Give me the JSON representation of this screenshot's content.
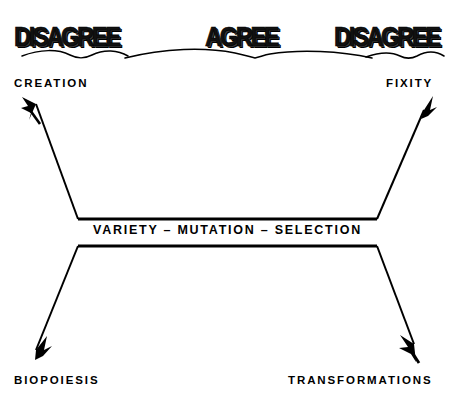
{
  "header": {
    "items": [
      {
        "label": "DISAGREE",
        "position": "left"
      },
      {
        "label": "AGREE",
        "position": "center"
      },
      {
        "label": "DISAGREE",
        "position": "right"
      }
    ],
    "divider": "wavy-rule"
  },
  "diagram": {
    "type": "bowtie-divergence",
    "center": {
      "label": "VARIETY – MUTATION – SELECTION"
    },
    "branches": [
      {
        "id": "creation",
        "label": "CREATION",
        "corner": "top-left",
        "arrow_direction": "down-right",
        "arrow_points_toward": "center",
        "stance": "DISAGREE"
      },
      {
        "id": "fixity",
        "label": "FIXITY",
        "corner": "top-right",
        "arrow_direction": "up-right",
        "arrow_points_toward": "outward",
        "stance": "DISAGREE"
      },
      {
        "id": "biopoiesis",
        "label": "BIOPOIESIS",
        "corner": "bottom-left",
        "arrow_direction": "up-right",
        "arrow_points_toward": "center",
        "stance": "DISAGREE"
      },
      {
        "id": "transformations",
        "label": "TRANSFORMATIONS",
        "corner": "bottom-right",
        "arrow_direction": "down-right",
        "arrow_points_toward": "outward",
        "stance": "DISAGREE"
      }
    ]
  },
  "colors": {
    "background": "#ffffff",
    "ink": "#000000"
  }
}
